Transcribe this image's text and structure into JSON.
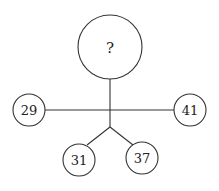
{
  "diagram": {
    "center": {
      "label": "?"
    },
    "nodes": [
      {
        "id": "left",
        "label": "29"
      },
      {
        "id": "right",
        "label": "41"
      },
      {
        "id": "bottom-left",
        "label": "31"
      },
      {
        "id": "bottom-right",
        "label": "37"
      }
    ]
  }
}
